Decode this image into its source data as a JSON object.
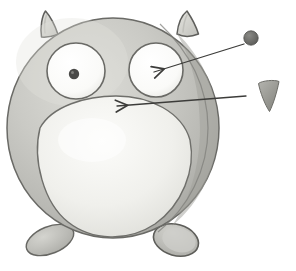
{
  "illustration": {
    "title": "Gopher mascot annotated sketch",
    "subject": "gopher-character",
    "style": "grayscale pencil and watercolor sketch",
    "background_color": "#ffffff"
  },
  "canvas": {
    "width": 296,
    "height": 271
  },
  "palette": {
    "body_fill": "#c2c2bd",
    "body_fill_light": "#d2d2cd",
    "body_fill_dark": "#a9a9a4",
    "belly_fill": "#eeeeea",
    "eye_white": "#fbfbfa",
    "pupil_fill": "#4a4a48",
    "horn_fill": "#d8d8d3",
    "foot_fill": "#bcbcb7",
    "outline": "#5e5e5b",
    "annotation_line": "#3c3c3a",
    "legend_dot": "#6d6d6a",
    "legend_triangle": "#9a9a95"
  },
  "figure": {
    "body": {
      "name": "gopher-body",
      "cx": 113,
      "cy": 128,
      "rx": 106,
      "ry": 110
    },
    "belly": {
      "name": "gopher-belly",
      "cx": 116,
      "cy": 165,
      "rx": 76,
      "ry": 75
    },
    "horns": [
      {
        "name": "horn-left",
        "points": "40,36 45,11 58,34"
      },
      {
        "name": "horn-right",
        "points": "177,33 187,11 198,34"
      }
    ],
    "eyes": [
      {
        "name": "eye-left",
        "cx": 76,
        "cy": 71,
        "rx": 29,
        "ry": 28,
        "pupil": {
          "cx": 74,
          "cy": 74,
          "r": 5
        }
      },
      {
        "name": "eye-right",
        "cx": 156,
        "cy": 70,
        "rx": 27,
        "ry": 27,
        "pupil": null
      }
    ],
    "feet": [
      {
        "name": "foot-left",
        "cx": 50,
        "cy": 240,
        "rx": 24,
        "ry": 13,
        "rotate": -22
      },
      {
        "name": "foot-right",
        "cx": 176,
        "cy": 240,
        "rx": 23,
        "ry": 15,
        "rotate": 18
      }
    ]
  },
  "annotations": [
    {
      "id": "pupil-callout",
      "name": "annotation-pupil",
      "label": "pupil",
      "line": {
        "x1": 244,
        "y1": 44,
        "x2": 152,
        "y2": 72
      },
      "arrowhead_angle": 163,
      "legend_shape": "circle",
      "legend": {
        "cx": 251,
        "cy": 38,
        "r": 7
      }
    },
    {
      "id": "horn-callout",
      "name": "annotation-horn",
      "label": "horn",
      "line": {
        "x1": 244,
        "y1": 96,
        "x2": 114,
        "y2": 106
      },
      "arrowhead_angle": 184,
      "legend_shape": "triangle",
      "legend": {
        "points": "258,83 279,80 270,112"
      }
    }
  ]
}
